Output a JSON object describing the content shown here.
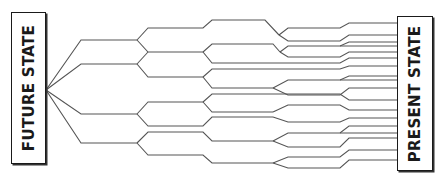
{
  "diagram": {
    "left_node": {
      "label": "FUTURE STATE"
    },
    "right_node": {
      "label": "PRESENT STATE"
    },
    "colors": {
      "line": "#555555",
      "box_border": "#1a1a1a",
      "text": "#1a1a1a",
      "background": "#ffffff"
    }
  }
}
